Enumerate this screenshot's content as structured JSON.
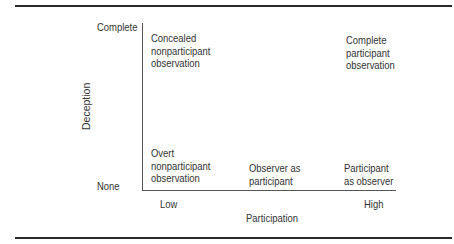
{
  "diagram": {
    "y_axis": {
      "label": "Deception",
      "ticks": {
        "top": "Complete",
        "bottom": "None"
      }
    },
    "x_axis": {
      "label": "Participation",
      "ticks": {
        "left": "Low",
        "right": "High"
      }
    },
    "cells": [
      {
        "position": "top-left",
        "lines": [
          "Concealed",
          "nonparticipant",
          "observation"
        ]
      },
      {
        "position": "top-right",
        "lines": [
          "Complete",
          "participant",
          "observation"
        ]
      },
      {
        "position": "bottom-left",
        "lines": [
          "Overt",
          "nonparticipant",
          "observation"
        ]
      },
      {
        "position": "bottom-middle",
        "lines": [
          "Observer as",
          "participant"
        ]
      },
      {
        "position": "bottom-right",
        "lines": [
          "Participant",
          "as observer"
        ]
      }
    ]
  }
}
